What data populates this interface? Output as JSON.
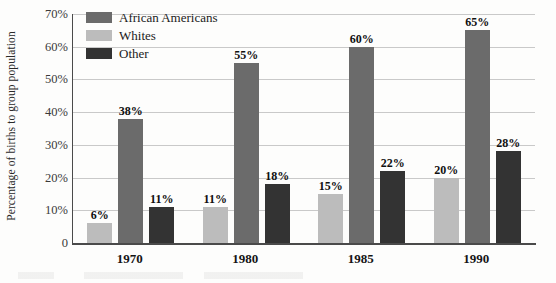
{
  "chart_data": {
    "type": "bar",
    "title": "",
    "subtitle": "",
    "xlabel": "",
    "ylabel": "Percentage of births to group population",
    "categories": [
      "1970",
      "1980",
      "1985",
      "1990"
    ],
    "ylim": [
      0,
      70
    ],
    "y_ticks": [
      "0",
      "10%",
      "20%",
      "30%",
      "40%",
      "50%",
      "60%",
      "70%"
    ],
    "y_tick_values": [
      0,
      10,
      20,
      30,
      40,
      50,
      60,
      70
    ],
    "grid": "horizontal",
    "legend_position": "top-left-inside",
    "series": [
      {
        "name": "African Americans",
        "color": "#6b6b6b",
        "order_in_group": 2,
        "values": [
          38,
          55,
          60,
          65
        ],
        "value_labels": [
          "38%",
          "55%",
          "60%",
          "65%"
        ]
      },
      {
        "name": "Whites",
        "color": "#bcbcbc",
        "order_in_group": 1,
        "values": [
          6,
          11,
          15,
          20
        ],
        "value_labels": [
          "6%",
          "11%",
          "15%",
          "20%"
        ]
      },
      {
        "name": "Other",
        "color": "#333333",
        "order_in_group": 3,
        "values": [
          11,
          18,
          22,
          28
        ],
        "value_labels": [
          "11%",
          "18%",
          "22%",
          "28%"
        ]
      }
    ]
  },
  "legend": {
    "items": [
      {
        "label": "African Americans",
        "color": "#6b6b6b"
      },
      {
        "label": "Whites",
        "color": "#bcbcbc"
      },
      {
        "label": "Other",
        "color": "#333333"
      }
    ]
  },
  "axis": {
    "y_title": "Percentage of births to group population",
    "y_ticks": [
      "70%",
      "60%",
      "50%",
      "40%",
      "30%",
      "20%",
      "10%",
      "0"
    ],
    "x_ticks": [
      "1970",
      "1980",
      "1985",
      "1990"
    ]
  },
  "colors": {
    "african_americans": "#6b6b6b",
    "whites": "#bcbcbc",
    "other": "#333333",
    "gridline": "#c9c9c9",
    "axis": "#4a4a4a",
    "background": "#fdfdfc"
  }
}
